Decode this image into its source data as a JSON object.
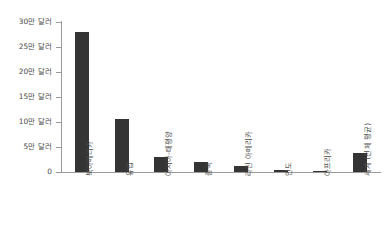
{
  "chart_data": {
    "type": "bar",
    "title": "",
    "xlabel": "",
    "ylabel": "",
    "categories": [
      "북아메리카",
      "유럽",
      "아시아-태평양",
      "중국",
      "라틴 아메리카",
      "인도",
      "아프리카",
      "세계 (전체 평균)"
    ],
    "values": [
      280000,
      107000,
      31000,
      21000,
      13000,
      4000,
      2500,
      38000
    ],
    "value_unit": "달러",
    "ylim": [
      0,
      300000
    ],
    "ytick_values": [
      0,
      50000,
      100000,
      150000,
      200000,
      250000,
      300000
    ],
    "ytick_labels": [
      "0",
      "5만 달러",
      "10만 달러",
      "15만 달러",
      "20만 달러",
      "25만 달러",
      "30만 달러"
    ],
    "grid": false,
    "legend": null,
    "legend_position": "none",
    "bar_color": "#343434",
    "axis_color": "#9a9a9a",
    "text_color": "#4a4a4a",
    "background_color": "#ffffff"
  }
}
